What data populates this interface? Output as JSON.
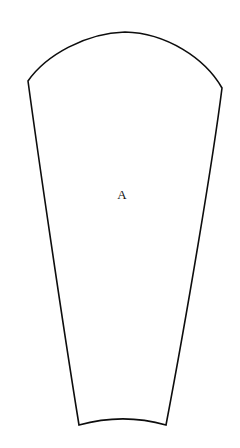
{
  "figure": {
    "domain": "technical-line-drawing",
    "caption": "",
    "background_color": "#ffffff",
    "stroke_color": "#0d0d0d",
    "stroke_width_px": 1.6,
    "canvas": {
      "width": 240,
      "height": 448
    },
    "label": {
      "text": "A",
      "x": 122,
      "y": 194,
      "font_size_px": 13,
      "color": "#111111"
    },
    "shape": {
      "name": "tapered-gore-panel",
      "description": "Truncated circular-sector pattern piece: convex arc at top, two near-straight tapering sides, concave-up arc at bottom",
      "vertices": {
        "top_arc_apex": {
          "x": 125,
          "y": 32
        },
        "top_left_corner": {
          "x": 28,
          "y": 81
        },
        "top_right_corner": {
          "x": 222,
          "y": 88
        },
        "bottom_left_corner": {
          "x": 79,
          "y": 425
        },
        "bottom_right_corner": {
          "x": 166,
          "y": 425
        },
        "bottom_arc_mid": {
          "x": 123,
          "y": 418
        }
      },
      "path": "M 28 81 C 46 55 86 33 125 32 C 166 33 205 58 222 88 C 213 160 186 320 166 425 C 138 417 108 417 79 425 C 62 320 38 155 28 81 Z"
    }
  }
}
